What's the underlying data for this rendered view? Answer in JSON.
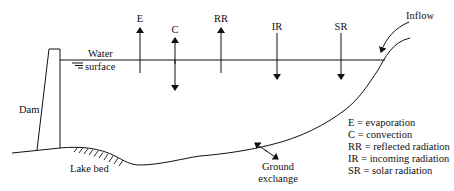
{
  "labels": {
    "E": "E",
    "C": "C",
    "RR": "RR",
    "IR": "IR",
    "SR": "SR",
    "inflow": "Inflow",
    "water_1": "Water",
    "water_2": "surface",
    "dam": "Dam",
    "lake_bed": "Lake bed",
    "ground_1": "Ground",
    "ground_2": "exchange"
  },
  "legend": [
    "E = evaporation",
    "C = convection",
    "RR = reflected radiation",
    "IR = incoming radiation",
    "SR = solar radiation"
  ]
}
